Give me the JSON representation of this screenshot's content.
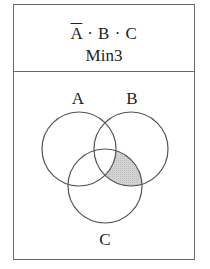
{
  "header": {
    "expression": {
      "terms": [
        {
          "name": "A",
          "complemented": true
        },
        {
          "name": "B",
          "complemented": false
        },
        {
          "name": "C",
          "complemented": false
        }
      ],
      "separator": " · "
    },
    "label": "Min3"
  },
  "diagram": {
    "sets": [
      {
        "name": "A",
        "label": "A"
      },
      {
        "name": "B",
        "label": "B"
      },
      {
        "name": "C",
        "label": "C"
      }
    ],
    "shaded_region": "A' ∩ B ∩ C",
    "shade_color": "#cfcfcf",
    "stroke_color": "#555555"
  }
}
